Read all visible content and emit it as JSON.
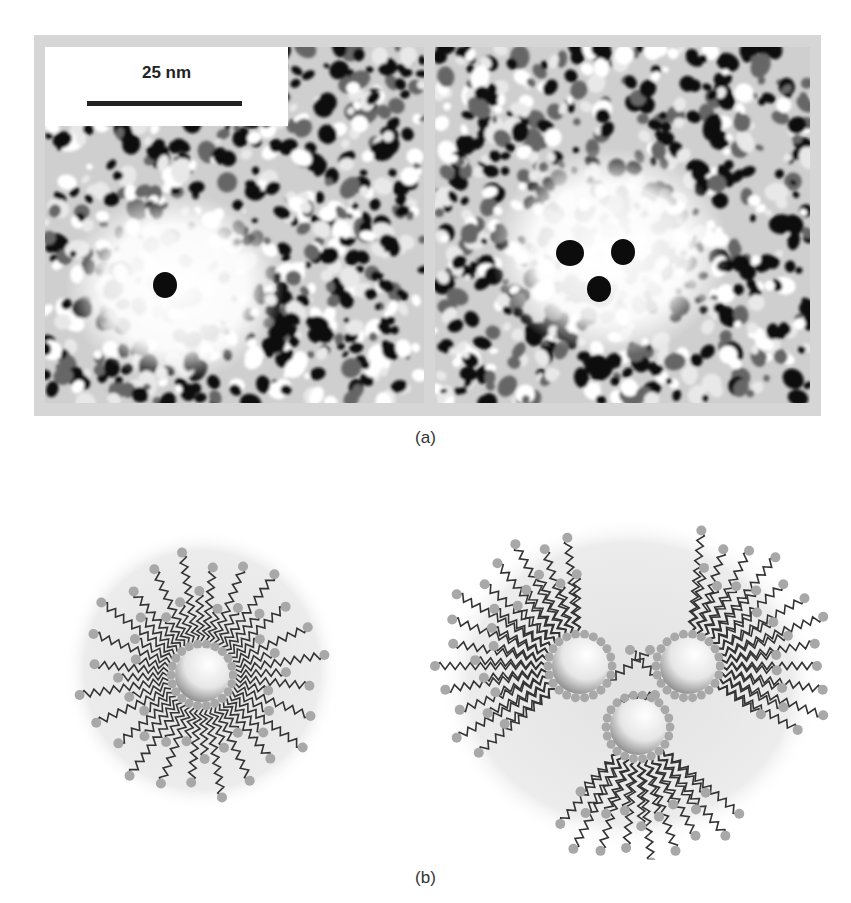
{
  "figure": {
    "panel_a": {
      "caption": "(a)",
      "images": [
        {
          "name": "tem-single-particle",
          "description": "TEM image showing micelle with one dark nanoparticle core"
        },
        {
          "name": "tem-three-particles",
          "description": "TEM image showing micelle with three dark nanoparticle cores"
        }
      ],
      "scale_bar": {
        "label": "25 nm"
      }
    },
    "panel_b": {
      "caption": "(b)",
      "diagrams": [
        {
          "name": "micelle-single-core",
          "cores": 1
        },
        {
          "name": "micelle-triple-core",
          "cores": 3
        }
      ]
    },
    "colors": {
      "frame": "#d6d6d6",
      "halo": "#ebebeb",
      "chain": "#333333",
      "headgroup": "#a8a8a8",
      "text": "#222222"
    }
  }
}
